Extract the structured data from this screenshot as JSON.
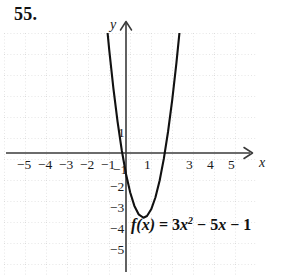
{
  "problem": {
    "number": "55."
  },
  "chart_data": {
    "type": "line",
    "title": "",
    "function_label": {
      "fname": "f",
      "arg": "(x)",
      "equals": "=",
      "coef": "3",
      "var1": "x",
      "exp": "2",
      "minus1": "−",
      "term2": "5",
      "var2": "x",
      "minus2": "−",
      "const": "1",
      "plain": "f(x) = 3x² − 5x − 1"
    },
    "equation": "f(x) = 3x^2 - 5x - 1",
    "coefficients": {
      "a": 3,
      "b": -5,
      "c": -1
    },
    "vertex": {
      "x": 0.833,
      "y": -3.083
    },
    "roots": [
      -0.18,
      1.847
    ],
    "y_intercept": -1,
    "xlabel": "x",
    "ylabel": "y",
    "xlim": [
      -5.8,
      6.0
    ],
    "ylim": [
      -5.8,
      5.7
    ],
    "grid": true,
    "grid_style": "dotted",
    "x_ticks": [
      "−5",
      "−4",
      "−3",
      "−2",
      "−1",
      "1",
      "3",
      "4",
      "5"
    ],
    "x_tick_values": [
      -5,
      -4,
      -3,
      -2,
      -1,
      1,
      3,
      4,
      5
    ],
    "y_ticks": [
      "1",
      "−1",
      "−2",
      "−3",
      "−4",
      "−5"
    ],
    "y_tick_values": [
      1,
      -1,
      -2,
      -3,
      -4,
      -5
    ],
    "curve_points": [
      {
        "x": -1.1,
        "y": 8.13
      },
      {
        "x": -1.0,
        "y": 7.0
      },
      {
        "x": -0.8,
        "y": 4.92
      },
      {
        "x": -0.6,
        "y": 3.08
      },
      {
        "x": -0.4,
        "y": 1.48
      },
      {
        "x": -0.2,
        "y": 0.12
      },
      {
        "x": 0.0,
        "y": -1.0
      },
      {
        "x": 0.2,
        "y": -1.88
      },
      {
        "x": 0.4,
        "y": -2.52
      },
      {
        "x": 0.6,
        "y": -2.92
      },
      {
        "x": 0.833,
        "y": -3.083
      },
      {
        "x": 1.0,
        "y": -3.0
      },
      {
        "x": 1.2,
        "y": -2.68
      },
      {
        "x": 1.4,
        "y": -2.12
      },
      {
        "x": 1.6,
        "y": -1.32
      },
      {
        "x": 1.8,
        "y": -0.28
      },
      {
        "x": 2.0,
        "y": 1.0
      },
      {
        "x": 2.2,
        "y": 2.52
      },
      {
        "x": 2.4,
        "y": 4.28
      },
      {
        "x": 2.55,
        "y": 5.77
      },
      {
        "x": 2.6,
        "y": 6.28
      }
    ],
    "colors": {
      "curve": "#111111",
      "axis": "#333333",
      "grid": "#cfcfcf",
      "text": "#1a1a1a"
    }
  }
}
